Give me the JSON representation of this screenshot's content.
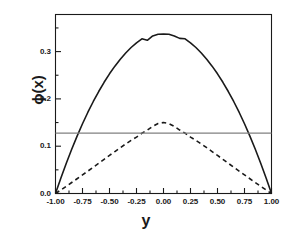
{
  "chart_data": {
    "type": "line",
    "title": "",
    "xlabel": "y",
    "ylabel": "ϕ(x)",
    "xlim": [
      -1.0,
      1.0
    ],
    "ylim": [
      0.0,
      0.3784
    ],
    "grid": false,
    "legend": null,
    "xticks": [
      -1.0,
      -0.75,
      -0.5,
      -0.25,
      0.0,
      0.25,
      0.5,
      0.75,
      1.0
    ],
    "xtick_labels": [
      "-1.00",
      "-0.75",
      "-0.50",
      "-0.25",
      "0.00",
      "0.25",
      "0.50",
      "0.75",
      "1.00"
    ],
    "yticks": [
      0.0,
      0.1,
      0.2,
      0.3
    ],
    "ytick_labels": [
      "0.0",
      "0.1",
      "0.2",
      "0.3"
    ],
    "yminor_ticks": [
      0.05,
      0.15,
      0.25,
      0.35
    ],
    "xminor_ticks": [
      -0.875,
      -0.625,
      -0.375,
      -0.125,
      0.125,
      0.375,
      0.625,
      0.875
    ],
    "series": [
      {
        "name": "solid-curve",
        "style": "solid",
        "color": "#1a1a1a",
        "width": 1.6,
        "x": [
          -1.0,
          -0.95,
          -0.9,
          -0.85,
          -0.8,
          -0.75,
          -0.7,
          -0.65,
          -0.6,
          -0.55,
          -0.5,
          -0.45,
          -0.4,
          -0.35,
          -0.3,
          -0.25,
          -0.2,
          -0.15,
          -0.1,
          -0.05,
          0.0,
          0.05,
          0.1,
          0.15,
          0.2,
          0.25,
          0.3,
          0.35,
          0.4,
          0.45,
          0.5,
          0.55,
          0.6,
          0.65,
          0.7,
          0.75,
          0.8,
          0.85,
          0.9,
          0.95,
          1.0
        ],
        "y": [
          0.0,
          0.0329,
          0.0641,
          0.0936,
          0.1213,
          0.1474,
          0.1718,
          0.1945,
          0.2156,
          0.2351,
          0.253,
          0.2692,
          0.2839,
          0.297,
          0.3086,
          0.3186,
          0.327,
          0.3239,
          0.333,
          0.3365,
          0.337,
          0.3365,
          0.333,
          0.3279,
          0.327,
          0.3186,
          0.3086,
          0.297,
          0.2839,
          0.2692,
          0.253,
          0.2351,
          0.2156,
          0.1945,
          0.1718,
          0.1474,
          0.1213,
          0.0936,
          0.0641,
          0.0329,
          0.0
        ]
      },
      {
        "name": "dashed-curve",
        "style": "dashed",
        "color": "#1a1a1a",
        "width": 1.6,
        "x": [
          -1.0,
          -0.95,
          -0.9,
          -0.85,
          -0.8,
          -0.75,
          -0.7,
          -0.65,
          -0.6,
          -0.55,
          -0.5,
          -0.45,
          -0.4,
          -0.35,
          -0.3,
          -0.25,
          -0.2,
          -0.15,
          -0.1,
          -0.05,
          0.0,
          0.05,
          0.1,
          0.15,
          0.2,
          0.25,
          0.3,
          0.35,
          0.4,
          0.45,
          0.5,
          0.55,
          0.6,
          0.65,
          0.7,
          0.75,
          0.8,
          0.85,
          0.9,
          0.95,
          1.0
        ],
        "y": [
          0.0,
          0.0075,
          0.0153,
          0.0232,
          0.0312,
          0.0393,
          0.0474,
          0.0556,
          0.0639,
          0.0722,
          0.0805,
          0.0887,
          0.0968,
          0.1047,
          0.1122,
          0.1192,
          0.1275,
          0.1341,
          0.142,
          0.1478,
          0.15,
          0.1478,
          0.142,
          0.1341,
          0.1275,
          0.1192,
          0.1122,
          0.1047,
          0.0968,
          0.0887,
          0.0805,
          0.0722,
          0.0639,
          0.0556,
          0.0474,
          0.0393,
          0.0312,
          0.0232,
          0.0153,
          0.0075,
          0.0
        ]
      },
      {
        "name": "horizontal-reference-line",
        "style": "solid",
        "color": "#808080",
        "width": 1.3,
        "x": [
          -1.0,
          1.0
        ],
        "y": [
          0.1275,
          0.1275
        ]
      }
    ]
  },
  "axes": {
    "frame_color": "#1a1a1a"
  }
}
